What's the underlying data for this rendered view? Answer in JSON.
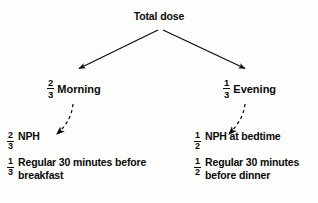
{
  "diagram": {
    "title": "Total dose",
    "type": "insulin-dose-split-flowchart",
    "background_color": "#fdfdfb",
    "ink_color": "#0a0a0a"
  },
  "root": {
    "label": "Total dose"
  },
  "branches": [
    {
      "id": "morning",
      "fraction_numerator": "2",
      "fraction_denominator": "3",
      "label": "Morning"
    },
    {
      "id": "evening",
      "fraction_numerator": "1",
      "fraction_denominator": "3",
      "label": "Evening"
    }
  ],
  "details": {
    "morning": [
      {
        "fraction_numerator": "2",
        "fraction_denominator": "3",
        "text": "NPH"
      },
      {
        "fraction_numerator": "1",
        "fraction_denominator": "3",
        "text": "Regular 30 minutes before breakfast"
      }
    ],
    "evening": [
      {
        "fraction_numerator": "1",
        "fraction_denominator": "2",
        "text": "NPH at bedtime"
      },
      {
        "fraction_numerator": "1",
        "fraction_denominator": "2",
        "text": "Regular 30 minutes before dinner"
      }
    ]
  },
  "connectors": [
    {
      "id": "root-to-morning",
      "style": "solid",
      "arrowhead": "filled-triangle"
    },
    {
      "id": "root-to-evening",
      "style": "solid",
      "arrowhead": "filled-triangle"
    },
    {
      "id": "morning-to-detail",
      "style": "dashed-curved",
      "arrowhead": "filled-triangle"
    },
    {
      "id": "evening-to-detail",
      "style": "dashed-curved",
      "arrowhead": "filled-triangle"
    }
  ]
}
